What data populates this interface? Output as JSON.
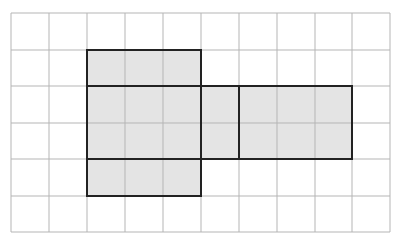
{
  "diagram": {
    "type": "grid-net",
    "grid": {
      "cols": 10,
      "rows": 6,
      "x_lines": [
        11,
        49,
        87,
        125,
        163,
        201,
        239,
        277,
        315,
        352,
        390
      ],
      "y_lines": [
        13,
        50,
        86,
        123,
        159,
        196,
        232
      ],
      "line_color": "#b5b5b5"
    },
    "fill_color": "#e4e4e4",
    "outline_color": "#222222",
    "shaded_cells": [
      [
        1,
        2
      ],
      [
        1,
        3
      ],
      [
        1,
        4
      ],
      [
        2,
        2
      ],
      [
        2,
        3
      ],
      [
        2,
        4
      ],
      [
        2,
        5
      ],
      [
        2,
        6
      ],
      [
        2,
        7
      ],
      [
        2,
        8
      ],
      [
        3,
        2
      ],
      [
        3,
        3
      ],
      [
        3,
        4
      ],
      [
        3,
        5
      ],
      [
        3,
        6
      ],
      [
        3,
        7
      ],
      [
        3,
        8
      ],
      [
        4,
        2
      ],
      [
        4,
        3
      ],
      [
        4,
        4
      ]
    ],
    "faces": [
      {
        "name": "top-face",
        "col": 2,
        "row": 1,
        "w": 3,
        "h": 1
      },
      {
        "name": "front-face",
        "col": 2,
        "row": 2,
        "w": 3,
        "h": 2
      },
      {
        "name": "bottom-face",
        "col": 2,
        "row": 4,
        "w": 3,
        "h": 1
      },
      {
        "name": "side-face",
        "col": 5,
        "row": 2,
        "w": 1,
        "h": 2
      },
      {
        "name": "back-face",
        "col": 6,
        "row": 2,
        "w": 3,
        "h": 2
      }
    ]
  }
}
